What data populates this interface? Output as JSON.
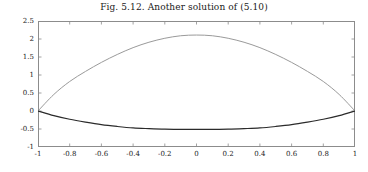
{
  "figure": {
    "title": "Fig. 5.12.  Another solution of (5.10)",
    "background": "#ffffff",
    "axis_color": "#8c8c8c",
    "text_color": "#222222"
  },
  "chart_data": {
    "type": "line",
    "title": "Fig. 5.12.  Another solution of (5.10)",
    "xlabel": "",
    "ylabel": "",
    "xlim": [
      -1,
      1
    ],
    "ylim": [
      -1,
      2.5
    ],
    "grid": false,
    "legend": null,
    "xticks": [
      -1,
      -0.8,
      -0.6,
      -0.4,
      -0.2,
      0,
      0.2,
      0.4,
      0.6,
      0.8,
      1
    ],
    "xticklabels": [
      "-1",
      "-0.8",
      "-0.6",
      "-0.4",
      "-0.2",
      "0",
      "0.2",
      "0.4",
      "0.6",
      "0.8",
      "1"
    ],
    "yticks": [
      -1,
      -0.5,
      0,
      0.5,
      1,
      1.5,
      2,
      2.5
    ],
    "yticklabels": [
      "-1",
      "-0.5",
      "0",
      "0.5",
      "1",
      "1.5",
      "2",
      "2.5"
    ],
    "x": [
      -1,
      -0.9,
      -0.8,
      -0.7,
      -0.6,
      -0.5,
      -0.4,
      -0.3,
      -0.2,
      -0.1,
      0,
      0.1,
      0.2,
      0.3,
      0.4,
      0.5,
      0.6,
      0.7,
      0.8,
      0.9,
      1
    ],
    "series": [
      {
        "name": "upper-solution",
        "color": "#9a9a9a",
        "linewidth": 1,
        "values": [
          0,
          0.46,
          0.82,
          1.1,
          1.35,
          1.57,
          1.76,
          1.91,
          2.02,
          2.09,
          2.11,
          2.09,
          2.02,
          1.91,
          1.76,
          1.57,
          1.35,
          1.1,
          0.82,
          0.46,
          0
        ]
      },
      {
        "name": "lower-solution",
        "color": "#2b2b2b",
        "linewidth": 1.2,
        "values": [
          0,
          -0.13,
          -0.23,
          -0.31,
          -0.38,
          -0.43,
          -0.47,
          -0.49,
          -0.505,
          -0.51,
          -0.512,
          -0.51,
          -0.505,
          -0.49,
          -0.47,
          -0.43,
          -0.38,
          -0.31,
          -0.23,
          -0.13,
          0
        ]
      }
    ]
  }
}
